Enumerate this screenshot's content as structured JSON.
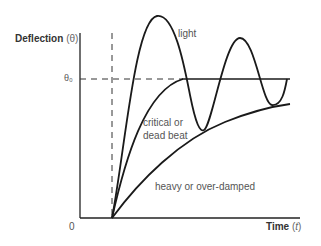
{
  "diagram": {
    "y_axis_label": "Deflection",
    "y_axis_symbol": "θ",
    "x_axis_label": "Time",
    "x_axis_symbol": "t",
    "origin_label": "0",
    "steady_level_label": "θ₀",
    "curves": [
      {
        "name": "light",
        "label": "light",
        "description": "under-damped oscillation about θ₀"
      },
      {
        "name": "critical",
        "label_line1": "critical or",
        "label_line2": "dead beat",
        "description": "reaches θ₀ without overshoot"
      },
      {
        "name": "heavy",
        "label": "heavy or over-damped",
        "description": "slow approach toward θ₀"
      }
    ],
    "colors": {
      "curve": "#1a1a1a",
      "axis": "#222222",
      "text": "#555555"
    }
  }
}
